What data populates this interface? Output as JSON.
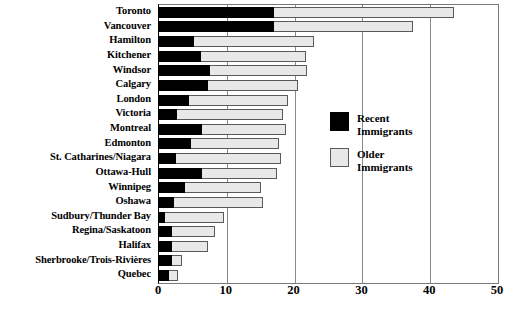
{
  "chart_data": {
    "type": "bar",
    "orientation": "horizontal",
    "stacked": true,
    "title": "",
    "subtitle": "",
    "xlabel": "",
    "ylabel": "",
    "xlim": [
      0,
      50
    ],
    "xticks": [
      0,
      10,
      20,
      30,
      40,
      50
    ],
    "xtick_labels": [
      "0",
      "10",
      "20",
      "30",
      "40",
      "50"
    ],
    "grid": true,
    "grid_axis": "x",
    "legend_position": "inside-right",
    "categories": [
      "Toronto",
      "Vancouver",
      "Hamilton",
      "Kitchener",
      "Windsor",
      "Calgary",
      "London",
      "Victoria",
      "Montreal",
      "Edmonton",
      "St. Catharines/Niagara",
      "Ottawa-Hull",
      "Winnipeg",
      "Oshawa",
      "Sudbury/Thunder Bay",
      "Regina/Saskatoon",
      "Halifax",
      "Sherbrooke/Trois-Rivières",
      "Quebec"
    ],
    "series": [
      {
        "name": "Recent Immigrants",
        "color": "#000000",
        "values": [
          17.0,
          17.0,
          5.2,
          6.2,
          7.5,
          7.2,
          4.4,
          2.7,
          6.3,
          4.7,
          2.5,
          6.4,
          3.8,
          2.2,
          0.9,
          1.9,
          1.9,
          1.9,
          1.5
        ]
      },
      {
        "name": "Older Immigrants",
        "color": "#e8e8e8",
        "values": [
          26.5,
          20.5,
          17.7,
          15.5,
          14.3,
          13.3,
          14.6,
          15.6,
          12.4,
          13.0,
          15.5,
          11.0,
          11.2,
          13.1,
          8.7,
          6.3,
          5.3,
          1.5,
          1.3
        ]
      }
    ],
    "totals": [
      43.5,
      37.5,
      22.9,
      21.7,
      21.8,
      20.5,
      19.0,
      18.3,
      18.7,
      17.7,
      18.0,
      17.4,
      15.0,
      15.3,
      9.6,
      8.2,
      7.2,
      3.4,
      2.8
    ]
  },
  "legend": {
    "entries": [
      {
        "label": "Recent Immigrants",
        "swatch": "recent"
      },
      {
        "label": "Older Immigrants",
        "swatch": "older"
      }
    ]
  }
}
